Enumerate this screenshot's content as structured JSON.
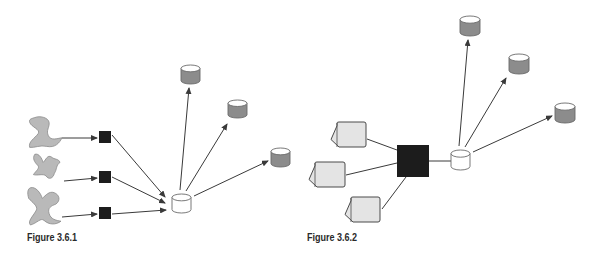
{
  "colors": {
    "background": "#ffffff",
    "line": "#3a3a3a",
    "blob_fill": "#b9b9b9",
    "blob_stroke": "#8a8a8a",
    "black_box": "#1c1c1c",
    "db_gray_body": "#8c8c8c",
    "db_gray_top": "#ffffff",
    "db_white_body": "#ffffff",
    "db_stroke": "#6a6a6a",
    "doc_fill": "#e4e4e4",
    "doc_stroke": "#4a4a4a"
  },
  "figures": [
    {
      "id": "fig-3-6-1",
      "caption": "Figure 3.6.1",
      "caption_pos": {
        "x": 27,
        "y": 231
      },
      "sources": [
        {
          "type": "blob",
          "variant": 1,
          "x": 28,
          "y": 116,
          "w": 34,
          "h": 32
        },
        {
          "type": "blob",
          "variant": 2,
          "x": 32,
          "y": 153,
          "w": 28,
          "h": 27
        },
        {
          "type": "blob",
          "variant": 3,
          "x": 27,
          "y": 187,
          "w": 34,
          "h": 38
        }
      ],
      "processors": [
        {
          "type": "black-square",
          "x": 99,
          "y": 131,
          "size": 12
        },
        {
          "type": "black-square",
          "x": 99,
          "y": 171,
          "size": 12
        },
        {
          "type": "black-square",
          "x": 99,
          "y": 207,
          "size": 12
        }
      ],
      "hub": {
        "type": "database",
        "fill": "white",
        "x": 172,
        "y": 194,
        "w": 19,
        "h": 19
      },
      "targets": [
        {
          "type": "database",
          "fill": "gray",
          "x": 181,
          "y": 65,
          "w": 19,
          "h": 19
        },
        {
          "type": "database",
          "fill": "gray",
          "x": 228,
          "y": 100,
          "w": 19,
          "h": 18
        },
        {
          "type": "database",
          "fill": "gray",
          "x": 271,
          "y": 148,
          "w": 19,
          "h": 19
        }
      ],
      "edges": [
        {
          "from": [
            62,
            138
          ],
          "to": [
            97,
            138
          ],
          "arrow": true
        },
        {
          "from": [
            64,
            181
          ],
          "to": [
            97,
            178
          ],
          "arrow": true
        },
        {
          "from": [
            62,
            217
          ],
          "to": [
            97,
            214
          ],
          "arrow": true
        },
        {
          "from": [
            112,
            135
          ],
          "to": [
            165,
            197
          ],
          "arrow": true
        },
        {
          "from": [
            112,
            177
          ],
          "to": [
            165,
            203
          ],
          "arrow": true
        },
        {
          "from": [
            112,
            214
          ],
          "to": [
            166,
            210
          ],
          "arrow": true
        },
        {
          "from": [
            180,
            190
          ],
          "to": [
            189,
            88
          ],
          "arrow": true
        },
        {
          "from": [
            186,
            191
          ],
          "to": [
            227,
            124
          ],
          "arrow": true
        },
        {
          "from": [
            194,
            196
          ],
          "to": [
            268,
            161
          ],
          "arrow": true
        }
      ]
    },
    {
      "id": "fig-3-6-2",
      "caption": "Figure 3.6.2",
      "caption_pos": {
        "x": 307,
        "y": 231
      },
      "sources": [
        {
          "type": "document",
          "x": 331,
          "y": 122,
          "w": 35,
          "h": 25
        },
        {
          "type": "document",
          "x": 309,
          "y": 162,
          "w": 36,
          "h": 25
        },
        {
          "type": "document",
          "x": 345,
          "y": 197,
          "w": 35,
          "h": 25
        }
      ],
      "processors": [
        {
          "type": "black-square",
          "x": 397,
          "y": 145,
          "size": 32
        }
      ],
      "hub": {
        "type": "database",
        "fill": "white",
        "x": 451,
        "y": 150,
        "w": 19,
        "h": 20
      },
      "targets": [
        {
          "type": "database",
          "fill": "gray",
          "x": 460,
          "y": 16,
          "w": 20,
          "h": 20
        },
        {
          "type": "database",
          "fill": "gray",
          "x": 509,
          "y": 54,
          "w": 20,
          "h": 20
        },
        {
          "type": "database",
          "fill": "gray",
          "x": 555,
          "y": 103,
          "w": 20,
          "h": 20
        }
      ],
      "edges": [
        {
          "from": [
            367,
            139
          ],
          "to": [
            397,
            150
          ],
          "arrow": false
        },
        {
          "from": [
            346,
            175
          ],
          "to": [
            397,
            163
          ],
          "arrow": false
        },
        {
          "from": [
            382,
            209
          ],
          "to": [
            406,
            177
          ],
          "arrow": false
        },
        {
          "from": [
            429,
            161
          ],
          "to": [
            451,
            161
          ],
          "arrow": false
        },
        {
          "from": [
            459,
            146
          ],
          "to": [
            468,
            40
          ],
          "arrow": true
        },
        {
          "from": [
            465,
            147
          ],
          "to": [
            506,
            78
          ],
          "arrow": true
        },
        {
          "from": [
            473,
            152
          ],
          "to": [
            552,
            116
          ],
          "arrow": true
        }
      ]
    }
  ]
}
